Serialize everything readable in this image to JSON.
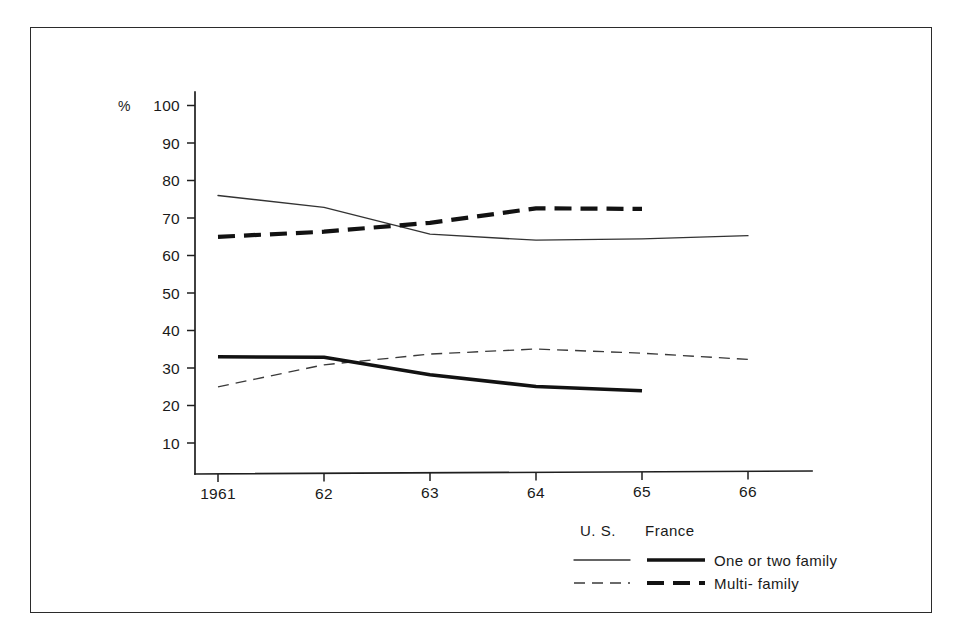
{
  "chart_data": {
    "type": "line",
    "title": "",
    "xlabel": "",
    "ylabel": "%",
    "ylim": [
      0,
      100
    ],
    "xlim": [
      1961,
      1966
    ],
    "grid": false,
    "legend_position": "bottom-right",
    "x": [
      1961,
      1962,
      1963,
      1964,
      1965,
      1966
    ],
    "xtick_labels": [
      "1961",
      "62",
      "63",
      "64",
      "65",
      "66"
    ],
    "ytick_labels": [
      "10",
      "20",
      "30",
      "40",
      "50",
      "60",
      "70",
      "80",
      "90",
      "100"
    ],
    "ytick_values": [
      10,
      20,
      30,
      40,
      50,
      60,
      70,
      80,
      90,
      100
    ],
    "series": [
      {
        "name": "U.S. One or two family",
        "country": "U.S.",
        "dwelling": "One or two family",
        "style": "thin-solid",
        "x": [
          1961,
          1962,
          1963,
          1964,
          1965,
          1966
        ],
        "values": [
          76,
          73,
          66,
          64.5,
          65,
          66
        ]
      },
      {
        "name": "U.S. Multi-family",
        "country": "U.S.",
        "dwelling": "Multi-family",
        "style": "thin-dashed",
        "x": [
          1961,
          1962,
          1963,
          1964,
          1965,
          1966
        ],
        "values": [
          25,
          31,
          34,
          35.5,
          34.5,
          33
        ]
      },
      {
        "name": "France One or two family",
        "country": "France",
        "dwelling": "One or two family",
        "style": "thick-solid",
        "x": [
          1961,
          1962,
          1963,
          1964,
          1965
        ],
        "values": [
          33,
          33,
          28.5,
          25.5,
          24.5
        ]
      },
      {
        "name": "France Multi-family",
        "country": "France",
        "dwelling": "Multi-family",
        "style": "thick-dashed",
        "x": [
          1961,
          1962,
          1963,
          1964,
          1965
        ],
        "values": [
          65,
          66.5,
          69,
          73,
          73
        ]
      }
    ]
  },
  "axis": {
    "percent_symbol": "%",
    "y_ticks": [
      "100",
      "90",
      "80",
      "70",
      "60",
      "50",
      "40",
      "30",
      "20",
      "10"
    ],
    "x_ticks": [
      "1961",
      "62",
      "63",
      "64",
      "65",
      "66"
    ]
  },
  "legend": {
    "column_headers": [
      "U. S.",
      "France"
    ],
    "rows": [
      {
        "label": "One or two family"
      },
      {
        "label": "Multi- family"
      }
    ]
  },
  "colors": {
    "ink": "#1a1a1a",
    "thin_line": "#333333",
    "thick_line": "#121212",
    "frame": "#2b2b2b",
    "background": "#ffffff"
  }
}
